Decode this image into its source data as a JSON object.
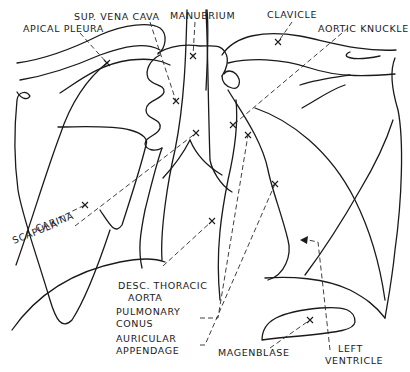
{
  "figure": {
    "colors": {
      "line": "#1a1a1a",
      "background": "#ffffff"
    }
  },
  "labels": {
    "sup_vena_cava": "SUP. VENA CAVA",
    "manubrium": "MANUBRIUM",
    "clavicle": "CLAVICLE",
    "apical_pleura": "APICAL PLEURA",
    "aortic_knuckle": "AORTIC KNUCKLE",
    "carina": "CARINA",
    "scapula": "SCAPULA",
    "desc_thoracic_aorta_1": "DESC. THORACIC",
    "desc_thoracic_aorta_2": "AORTA",
    "pulmonary_conus_1": "PULMONARY",
    "pulmonary_conus_2": "CONUS",
    "auricular_appendage_1": "AURICULAR",
    "auricular_appendage_2": "APPENDAGE",
    "magenblase": "MAGENBLASE",
    "left_ventricle_1": "LEFT",
    "left_ventricle_2": "VENTRICLE"
  },
  "markers": [
    {
      "name": "apical-pleura-marker",
      "x": 107,
      "y": 63
    },
    {
      "name": "manubrium-marker",
      "x": 193,
      "y": 56
    },
    {
      "name": "clavicle-marker",
      "x": 278,
      "y": 42
    },
    {
      "name": "sup-vena-cava-marker",
      "x": 176,
      "y": 101
    },
    {
      "name": "carina-marker",
      "x": 196,
      "y": 133
    },
    {
      "name": "aortic-knuckle-marker",
      "x": 233,
      "y": 125
    },
    {
      "name": "pulmonary-conus-marker",
      "x": 248,
      "y": 135
    },
    {
      "name": "auricular-appendage-marker",
      "x": 275,
      "y": 184
    },
    {
      "name": "desc-aorta-marker",
      "x": 212,
      "y": 221
    },
    {
      "name": "scapula-marker",
      "x": 85,
      "y": 205
    },
    {
      "name": "magenblase-marker",
      "x": 310,
      "y": 320
    }
  ]
}
